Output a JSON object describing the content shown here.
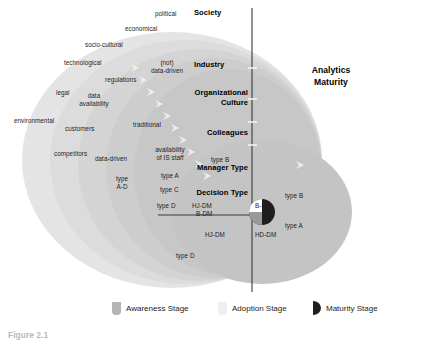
{
  "figure": {
    "title_right": {
      "line1": "Analytics",
      "line2": "Maturity"
    },
    "layers": [
      {
        "name": "Society",
        "label": "Society"
      },
      {
        "name": "Industry",
        "label": "Industry"
      },
      {
        "name": "Organizational Culture",
        "label_line1": "Organizational",
        "label_line2": "Culture"
      },
      {
        "name": "Colleagues",
        "label": "Colleagues"
      },
      {
        "name": "Manager Type",
        "label": "Manager Type"
      },
      {
        "name": "Decision Type",
        "label": "Decision Type"
      }
    ],
    "society_factors": [
      {
        "text": "political"
      },
      {
        "text": "economical"
      },
      {
        "text": "socio-cultural"
      },
      {
        "text": "technological"
      },
      {
        "text": "legal"
      },
      {
        "text": "environmental"
      }
    ],
    "industry_factors": [
      {
        "text": "regulations"
      },
      {
        "text": "customers"
      },
      {
        "text": "competitors"
      },
      {
        "text": "(not)"
      },
      {
        "text": "data-driven"
      }
    ],
    "org_culture_factors": [
      {
        "line1": "data",
        "line2": "availability"
      },
      {
        "text": "data-driven"
      },
      {
        "text": "traditional"
      }
    ],
    "colleagues_factors": [
      {
        "line1": "availability",
        "line2": "of IS staff"
      }
    ],
    "manager_types_left": [
      {
        "line1": "type",
        "line2": "A-D"
      },
      {
        "text": "type A"
      },
      {
        "text": "type C"
      },
      {
        "text": "type D"
      },
      {
        "text": "type B"
      }
    ],
    "manager_types_right": [
      {
        "text": "type B"
      },
      {
        "text": "type A"
      }
    ],
    "decision_types": [
      {
        "text": "HJ-DM"
      },
      {
        "text": "B-DM"
      },
      {
        "text": "B-DM"
      },
      {
        "text": "HJ-DM"
      },
      {
        "text": "HD-DM"
      },
      {
        "text": "type D"
      }
    ],
    "legend": [
      {
        "label": "Awareness Stage",
        "icon": "awareness-swatch",
        "color": "#b5b5b5"
      },
      {
        "label": "Adoption Stage",
        "icon": "adoption-swatch",
        "color": "#efefef"
      },
      {
        "label": "Maturity Stage",
        "icon": "maturity-swatch",
        "color": "#1f1f1f"
      }
    ],
    "colors": {
      "ellipse_1": "#e2e2e2",
      "ellipse_2": "#dadada",
      "ellipse_3": "#d2d2d2",
      "ellipse_4": "#cacaca",
      "ellipse_5": "#c2c2c2",
      "ellipse_right": "#c6c6c6",
      "axis": "#3a3a3a",
      "core_dark": "#1f1f1f"
    },
    "caption_partial": "Figure 2.1"
  }
}
